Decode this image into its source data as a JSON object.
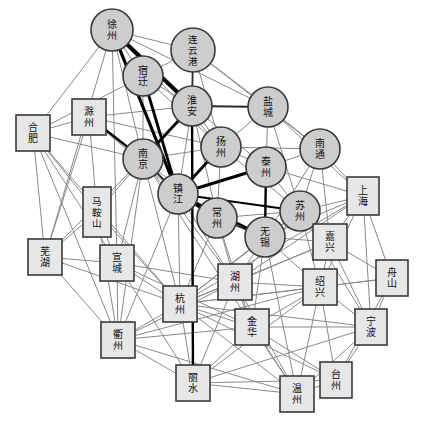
{
  "graph": {
    "canvas": {
      "width": 425,
      "height": 428,
      "background": "#ffffff"
    },
    "styles": {
      "circle_fill": "#cdcdcd",
      "circle_stroke": "#3a3a3a",
      "square_fill": "#e7e7e7",
      "square_stroke": "#3a3a3a",
      "edge_thin_color": "#8a8a8a",
      "edge_thin_width": 1,
      "edge_medium_color": "#2b2b2b",
      "edge_medium_width": 1.8,
      "edge_bold_color": "#000000",
      "label_color": "#111111",
      "label_font_size": 10
    },
    "legend_note": "circle = Jiangsu city, square = Shanghai / Zhejiang / Anhui city",
    "nodes": [
      {
        "id": "xuzhou",
        "label": "徐州",
        "shape": "circle",
        "x": 112,
        "y": 30,
        "r": 21
      },
      {
        "id": "lianyungang",
        "label": "连云港",
        "shape": "circle",
        "x": 193,
        "y": 50,
        "r": 22
      },
      {
        "id": "suqian",
        "label": "宿迁",
        "shape": "circle",
        "x": 143,
        "y": 76,
        "r": 20
      },
      {
        "id": "huaian",
        "label": "淮安",
        "shape": "circle",
        "x": 192,
        "y": 106,
        "r": 20
      },
      {
        "id": "yancheng",
        "label": "盐城",
        "shape": "circle",
        "x": 268,
        "y": 107,
        "r": 20
      },
      {
        "id": "chuzhou",
        "label": "滁州",
        "shape": "square",
        "x": 89,
        "y": 117,
        "w": 34,
        "h": 36
      },
      {
        "id": "hefei",
        "label": "合肥",
        "shape": "square",
        "x": 33,
        "y": 133,
        "w": 34,
        "h": 36
      },
      {
        "id": "yangzhou",
        "label": "扬州",
        "shape": "circle",
        "x": 221,
        "y": 147,
        "r": 20
      },
      {
        "id": "nantong",
        "label": "南通",
        "shape": "circle",
        "x": 320,
        "y": 149,
        "r": 20
      },
      {
        "id": "nanjing",
        "label": "南京",
        "shape": "circle",
        "x": 143,
        "y": 159,
        "r": 20
      },
      {
        "id": "taizhou_js",
        "label": "泰州",
        "shape": "circle",
        "x": 266,
        "y": 167,
        "r": 20
      },
      {
        "id": "shanghai",
        "label": "上海",
        "shape": "square",
        "x": 363,
        "y": 196,
        "w": 32,
        "h": 38
      },
      {
        "id": "zhenjiang",
        "label": "镇江",
        "shape": "circle",
        "x": 178,
        "y": 194,
        "r": 20
      },
      {
        "id": "maanshan",
        "label": "马鞍山",
        "shape": "square",
        "x": 97,
        "y": 212,
        "w": 28,
        "h": 50
      },
      {
        "id": "suzhou",
        "label": "苏州",
        "shape": "circle",
        "x": 300,
        "y": 211,
        "r": 20
      },
      {
        "id": "changzhou",
        "label": "常州",
        "shape": "circle",
        "x": 217,
        "y": 218,
        "r": 20
      },
      {
        "id": "wuxi",
        "label": "无锡",
        "shape": "circle",
        "x": 265,
        "y": 237,
        "r": 20
      },
      {
        "id": "jiaxing",
        "label": "嘉兴",
        "shape": "square",
        "x": 330,
        "y": 242,
        "w": 34,
        "h": 36
      },
      {
        "id": "wuhu",
        "label": "芜湖",
        "shape": "square",
        "x": 45,
        "y": 257,
        "w": 34,
        "h": 36
      },
      {
        "id": "xuancheng",
        "label": "宣城",
        "shape": "square",
        "x": 117,
        "y": 263,
        "w": 34,
        "h": 36
      },
      {
        "id": "zhoushan",
        "label": "舟山",
        "shape": "square",
        "x": 392,
        "y": 278,
        "w": 32,
        "h": 36
      },
      {
        "id": "huzhou",
        "label": "湖州",
        "shape": "square",
        "x": 235,
        "y": 282,
        "w": 34,
        "h": 36
      },
      {
        "id": "shaoxing",
        "label": "绍兴",
        "shape": "square",
        "x": 320,
        "y": 287,
        "w": 34,
        "h": 36
      },
      {
        "id": "hangzhou",
        "label": "杭州",
        "shape": "square",
        "x": 180,
        "y": 304,
        "w": 34,
        "h": 36
      },
      {
        "id": "jinhua",
        "label": "金华",
        "shape": "square",
        "x": 252,
        "y": 327,
        "w": 34,
        "h": 36
      },
      {
        "id": "ningbo",
        "label": "宁波",
        "shape": "square",
        "x": 371,
        "y": 327,
        "w": 32,
        "h": 36
      },
      {
        "id": "quzhou",
        "label": "衢州",
        "shape": "square",
        "x": 118,
        "y": 340,
        "w": 34,
        "h": 36
      },
      {
        "id": "taizhou_zj",
        "label": "台州",
        "shape": "square",
        "x": 336,
        "y": 380,
        "w": 32,
        "h": 36
      },
      {
        "id": "lishui",
        "label": "丽水",
        "shape": "square",
        "x": 193,
        "y": 383,
        "w": 34,
        "h": 36
      },
      {
        "id": "wenzhou",
        "label": "温州",
        "shape": "square",
        "x": 297,
        "y": 394,
        "w": 34,
        "h": 36
      }
    ],
    "edges": [
      {
        "from": "xuzhou",
        "to": "huaian",
        "weight": "bold",
        "width": 4
      },
      {
        "from": "xuzhou",
        "to": "zhenjiang",
        "weight": "bold",
        "width": 3.2
      },
      {
        "from": "suqian",
        "to": "zhenjiang",
        "weight": "bold",
        "width": 2.8
      },
      {
        "from": "huaian",
        "to": "nanjing",
        "weight": "bold",
        "width": 2.8
      },
      {
        "from": "huaian",
        "to": "lishui",
        "weight": "bold",
        "width": 2.4
      },
      {
        "from": "chuzhou",
        "to": "nanjing",
        "weight": "bold",
        "width": 2.4
      },
      {
        "from": "zhenjiang",
        "to": "yangzhou",
        "weight": "bold",
        "width": 2.8
      },
      {
        "from": "zhenjiang",
        "to": "taizhou_js",
        "weight": "bold",
        "width": 3.2
      },
      {
        "from": "zhenjiang",
        "to": "changzhou",
        "weight": "bold",
        "width": 2.4
      },
      {
        "from": "zhenjiang",
        "to": "wuxi",
        "weight": "bold",
        "width": 2.8
      },
      {
        "from": "zhenjiang",
        "to": "suzhou",
        "weight": "bold",
        "width": 2.2
      },
      {
        "from": "taizhou_js",
        "to": "wuxi",
        "weight": "bold",
        "width": 2.4
      },
      {
        "from": "lianyungang",
        "to": "huaian",
        "weight": "medium"
      },
      {
        "from": "huaian",
        "to": "yancheng",
        "weight": "medium"
      },
      {
        "from": "nanjing",
        "to": "zhenjiang",
        "weight": "medium"
      },
      {
        "from": "changzhou",
        "to": "wuxi",
        "weight": "medium"
      },
      {
        "from": "xuzhou",
        "to": "lianyungang",
        "weight": "thin"
      },
      {
        "from": "xuzhou",
        "to": "suqian",
        "weight": "thin"
      },
      {
        "from": "xuzhou",
        "to": "hefei",
        "weight": "thin"
      },
      {
        "from": "xuzhou",
        "to": "nanjing",
        "weight": "thin"
      },
      {
        "from": "xuzhou",
        "to": "yangzhou",
        "weight": "thin"
      },
      {
        "from": "xuzhou",
        "to": "yancheng",
        "weight": "thin"
      },
      {
        "from": "xuzhou",
        "to": "wuhu",
        "weight": "thin"
      },
      {
        "from": "xuzhou",
        "to": "xuancheng",
        "weight": "thin"
      },
      {
        "from": "lianyungang",
        "to": "suqian",
        "weight": "thin"
      },
      {
        "from": "lianyungang",
        "to": "yancheng",
        "weight": "thin"
      },
      {
        "from": "lianyungang",
        "to": "yangzhou",
        "weight": "thin"
      },
      {
        "from": "lianyungang",
        "to": "nantong",
        "weight": "thin"
      },
      {
        "from": "suqian",
        "to": "huaian",
        "weight": "thin"
      },
      {
        "from": "suqian",
        "to": "yangzhou",
        "weight": "thin"
      },
      {
        "from": "suqian",
        "to": "nanjing",
        "weight": "thin"
      },
      {
        "from": "huaian",
        "to": "yangzhou",
        "weight": "thin"
      },
      {
        "from": "huaian",
        "to": "taizhou_js",
        "weight": "thin"
      },
      {
        "from": "huaian",
        "to": "changzhou",
        "weight": "thin"
      },
      {
        "from": "huaian",
        "to": "zhenjiang",
        "weight": "thin"
      },
      {
        "from": "yancheng",
        "to": "yangzhou",
        "weight": "thin"
      },
      {
        "from": "yancheng",
        "to": "taizhou_js",
        "weight": "thin"
      },
      {
        "from": "yancheng",
        "to": "nantong",
        "weight": "thin"
      },
      {
        "from": "yancheng",
        "to": "suzhou",
        "weight": "thin"
      },
      {
        "from": "yancheng",
        "to": "shanghai",
        "weight": "thin"
      },
      {
        "from": "chuzhou",
        "to": "hefei",
        "weight": "thin"
      },
      {
        "from": "chuzhou",
        "to": "yangzhou",
        "weight": "thin"
      },
      {
        "from": "chuzhou",
        "to": "zhenjiang",
        "weight": "thin"
      },
      {
        "from": "chuzhou",
        "to": "maanshan",
        "weight": "thin"
      },
      {
        "from": "chuzhou",
        "to": "wuhu",
        "weight": "thin"
      },
      {
        "from": "chuzhou",
        "to": "huaian",
        "weight": "thin"
      },
      {
        "from": "hefei",
        "to": "nanjing",
        "weight": "thin"
      },
      {
        "from": "hefei",
        "to": "maanshan",
        "weight": "thin"
      },
      {
        "from": "hefei",
        "to": "wuhu",
        "weight": "thin"
      },
      {
        "from": "hefei",
        "to": "xuancheng",
        "weight": "thin"
      },
      {
        "from": "hefei",
        "to": "hangzhou",
        "weight": "thin"
      },
      {
        "from": "hefei",
        "to": "suqian",
        "weight": "thin"
      },
      {
        "from": "hefei",
        "to": "quzhou",
        "weight": "thin"
      },
      {
        "from": "yangzhou",
        "to": "taizhou_js",
        "weight": "thin"
      },
      {
        "from": "yangzhou",
        "to": "nantong",
        "weight": "thin"
      },
      {
        "from": "yangzhou",
        "to": "changzhou",
        "weight": "thin"
      },
      {
        "from": "yangzhou",
        "to": "suzhou",
        "weight": "thin"
      },
      {
        "from": "yangzhou",
        "to": "nanjing",
        "weight": "thin"
      },
      {
        "from": "nantong",
        "to": "taizhou_js",
        "weight": "thin"
      },
      {
        "from": "nantong",
        "to": "suzhou",
        "weight": "thin"
      },
      {
        "from": "nantong",
        "to": "shanghai",
        "weight": "thin"
      },
      {
        "from": "nantong",
        "to": "wuxi",
        "weight": "thin"
      },
      {
        "from": "nantong",
        "to": "jiaxing",
        "weight": "thin"
      },
      {
        "from": "nanjing",
        "to": "maanshan",
        "weight": "thin"
      },
      {
        "from": "nanjing",
        "to": "wuhu",
        "weight": "thin"
      },
      {
        "from": "nanjing",
        "to": "xuancheng",
        "weight": "thin"
      },
      {
        "from": "nanjing",
        "to": "changzhou",
        "weight": "thin"
      },
      {
        "from": "nanjing",
        "to": "hangzhou",
        "weight": "thin"
      },
      {
        "from": "nanjing",
        "to": "huzhou",
        "weight": "thin"
      },
      {
        "from": "nanjing",
        "to": "quzhou",
        "weight": "thin"
      },
      {
        "from": "nanjing",
        "to": "wenzhou",
        "weight": "thin"
      },
      {
        "from": "taizhou_js",
        "to": "suzhou",
        "weight": "thin"
      },
      {
        "from": "taizhou_js",
        "to": "shanghai",
        "weight": "thin"
      },
      {
        "from": "shanghai",
        "to": "suzhou",
        "weight": "thin"
      },
      {
        "from": "shanghai",
        "to": "jiaxing",
        "weight": "thin"
      },
      {
        "from": "shanghai",
        "to": "wuxi",
        "weight": "thin"
      },
      {
        "from": "shanghai",
        "to": "huzhou",
        "weight": "thin"
      },
      {
        "from": "shanghai",
        "to": "hangzhou",
        "weight": "thin"
      },
      {
        "from": "shanghai",
        "to": "ningbo",
        "weight": "thin"
      },
      {
        "from": "shanghai",
        "to": "zhoushan",
        "weight": "thin"
      },
      {
        "from": "shanghai",
        "to": "shaoxing",
        "weight": "thin"
      },
      {
        "from": "zhenjiang",
        "to": "huzhou",
        "weight": "thin"
      },
      {
        "from": "zhenjiang",
        "to": "hangzhou",
        "weight": "thin"
      },
      {
        "from": "zhenjiang",
        "to": "quzhou",
        "weight": "thin"
      },
      {
        "from": "maanshan",
        "to": "wuhu",
        "weight": "thin"
      },
      {
        "from": "maanshan",
        "to": "xuancheng",
        "weight": "thin"
      },
      {
        "from": "maanshan",
        "to": "hangzhou",
        "weight": "thin"
      },
      {
        "from": "maanshan",
        "to": "quzhou",
        "weight": "thin"
      },
      {
        "from": "suzhou",
        "to": "wuxi",
        "weight": "thin"
      },
      {
        "from": "suzhou",
        "to": "jiaxing",
        "weight": "thin"
      },
      {
        "from": "suzhou",
        "to": "huzhou",
        "weight": "thin"
      },
      {
        "from": "suzhou",
        "to": "hangzhou",
        "weight": "thin"
      },
      {
        "from": "suzhou",
        "to": "shaoxing",
        "weight": "thin"
      },
      {
        "from": "suzhou",
        "to": "ningbo",
        "weight": "thin"
      },
      {
        "from": "changzhou",
        "to": "huzhou",
        "weight": "thin"
      },
      {
        "from": "changzhou",
        "to": "hangzhou",
        "weight": "thin"
      },
      {
        "from": "changzhou",
        "to": "jinhua",
        "weight": "thin"
      },
      {
        "from": "changzhou",
        "to": "suzhou",
        "weight": "thin"
      },
      {
        "from": "wuxi",
        "to": "jiaxing",
        "weight": "thin"
      },
      {
        "from": "wuxi",
        "to": "huzhou",
        "weight": "thin"
      },
      {
        "from": "wuxi",
        "to": "hangzhou",
        "weight": "thin"
      },
      {
        "from": "wuxi",
        "to": "shaoxing",
        "weight": "thin"
      },
      {
        "from": "wuxi",
        "to": "jinhua",
        "weight": "thin"
      },
      {
        "from": "wuxi",
        "to": "wenzhou",
        "weight": "thin"
      },
      {
        "from": "jiaxing",
        "to": "huzhou",
        "weight": "thin"
      },
      {
        "from": "jiaxing",
        "to": "hangzhou",
        "weight": "thin"
      },
      {
        "from": "jiaxing",
        "to": "shaoxing",
        "weight": "thin"
      },
      {
        "from": "jiaxing",
        "to": "ningbo",
        "weight": "thin"
      },
      {
        "from": "jiaxing",
        "to": "zhoushan",
        "weight": "thin"
      },
      {
        "from": "wuhu",
        "to": "xuancheng",
        "weight": "thin"
      },
      {
        "from": "wuhu",
        "to": "hangzhou",
        "weight": "thin"
      },
      {
        "from": "wuhu",
        "to": "quzhou",
        "weight": "thin"
      },
      {
        "from": "xuancheng",
        "to": "hangzhou",
        "weight": "thin"
      },
      {
        "from": "xuancheng",
        "to": "huzhou",
        "weight": "thin"
      },
      {
        "from": "xuancheng",
        "to": "quzhou",
        "weight": "thin"
      },
      {
        "from": "xuancheng",
        "to": "jinhua",
        "weight": "thin"
      },
      {
        "from": "xuancheng",
        "to": "lishui",
        "weight": "thin"
      },
      {
        "from": "zhoushan",
        "to": "ningbo",
        "weight": "thin"
      },
      {
        "from": "zhoushan",
        "to": "shaoxing",
        "weight": "thin"
      },
      {
        "from": "zhoushan",
        "to": "taizhou_zj",
        "weight": "thin"
      },
      {
        "from": "zhoushan",
        "to": "hangzhou",
        "weight": "thin"
      },
      {
        "from": "huzhou",
        "to": "hangzhou",
        "weight": "thin"
      },
      {
        "from": "huzhou",
        "to": "shaoxing",
        "weight": "thin"
      },
      {
        "from": "huzhou",
        "to": "jinhua",
        "weight": "thin"
      },
      {
        "from": "huzhou",
        "to": "quzhou",
        "weight": "thin"
      },
      {
        "from": "huzhou",
        "to": "lishui",
        "weight": "thin"
      },
      {
        "from": "huzhou",
        "to": "wenzhou",
        "weight": "thin"
      },
      {
        "from": "shaoxing",
        "to": "hangzhou",
        "weight": "thin"
      },
      {
        "from": "shaoxing",
        "to": "ningbo",
        "weight": "thin"
      },
      {
        "from": "shaoxing",
        "to": "jinhua",
        "weight": "thin"
      },
      {
        "from": "shaoxing",
        "to": "taizhou_zj",
        "weight": "thin"
      },
      {
        "from": "shaoxing",
        "to": "wenzhou",
        "weight": "thin"
      },
      {
        "from": "shaoxing",
        "to": "lishui",
        "weight": "thin"
      },
      {
        "from": "hangzhou",
        "to": "jinhua",
        "weight": "thin"
      },
      {
        "from": "hangzhou",
        "to": "quzhou",
        "weight": "thin"
      },
      {
        "from": "hangzhou",
        "to": "lishui",
        "weight": "thin"
      },
      {
        "from": "hangzhou",
        "to": "wenzhou",
        "weight": "thin"
      },
      {
        "from": "hangzhou",
        "to": "ningbo",
        "weight": "thin"
      },
      {
        "from": "hangzhou",
        "to": "taizhou_zj",
        "weight": "thin"
      },
      {
        "from": "jinhua",
        "to": "quzhou",
        "weight": "thin"
      },
      {
        "from": "jinhua",
        "to": "lishui",
        "weight": "thin"
      },
      {
        "from": "jinhua",
        "to": "wenzhou",
        "weight": "thin"
      },
      {
        "from": "jinhua",
        "to": "ningbo",
        "weight": "thin"
      },
      {
        "from": "jinhua",
        "to": "taizhou_zj",
        "weight": "thin"
      },
      {
        "from": "ningbo",
        "to": "taizhou_zj",
        "weight": "thin"
      },
      {
        "from": "ningbo",
        "to": "wenzhou",
        "weight": "thin"
      },
      {
        "from": "ningbo",
        "to": "lishui",
        "weight": "thin"
      },
      {
        "from": "quzhou",
        "to": "lishui",
        "weight": "thin"
      },
      {
        "from": "quzhou",
        "to": "wenzhou",
        "weight": "thin"
      },
      {
        "from": "quzhou",
        "to": "shaoxing",
        "weight": "thin"
      },
      {
        "from": "lishui",
        "to": "wenzhou",
        "weight": "thin"
      },
      {
        "from": "lishui",
        "to": "taizhou_zj",
        "weight": "thin"
      },
      {
        "from": "taizhou_zj",
        "to": "wenzhou",
        "weight": "thin"
      }
    ]
  }
}
